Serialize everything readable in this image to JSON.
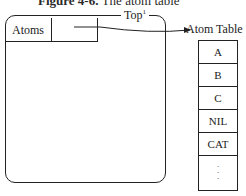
{
  "caption": {
    "label": "Figure 4-6.",
    "title": "The atom table"
  },
  "panel": {
    "cells": [
      "Atoms",
      ""
    ],
    "top_label": "Top",
    "top_superscript": "1"
  },
  "atom_table": {
    "title": "Atom Table",
    "rows": [
      "A",
      "B",
      "C",
      "NIL",
      "CAT"
    ],
    "ellipsis": [
      "·",
      "·",
      "·"
    ]
  },
  "colors": {
    "line": "#222222",
    "background": "#ffffff"
  }
}
